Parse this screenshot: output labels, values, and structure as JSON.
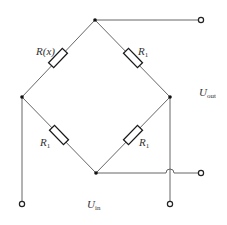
{
  "diagram": {
    "type": "wheatstone-bridge-circuit",
    "colors": {
      "wire": "#555555",
      "resistor": "#1a1a1a",
      "node": "#111111",
      "text": "#333333"
    },
    "resistors": [
      {
        "id": "rx",
        "label_main": "R(x)",
        "label_sub": "",
        "position": "upper-left"
      },
      {
        "id": "r1_upper_right",
        "label_main": "R",
        "label_sub": "1",
        "position": "upper-right"
      },
      {
        "id": "r1_lower_left",
        "label_main": "R",
        "label_sub": "1",
        "position": "lower-left"
      },
      {
        "id": "r1_lower_right",
        "label_main": "R",
        "label_sub": "1",
        "position": "lower-right"
      }
    ],
    "voltages": {
      "out": {
        "main": "U",
        "sub": "out"
      },
      "in": {
        "main": "U",
        "sub": "in"
      }
    },
    "nodes": [
      "top",
      "left",
      "right",
      "bottom"
    ],
    "terminals": [
      "top-out",
      "bottom-out",
      "left-in",
      "right-in"
    ]
  }
}
